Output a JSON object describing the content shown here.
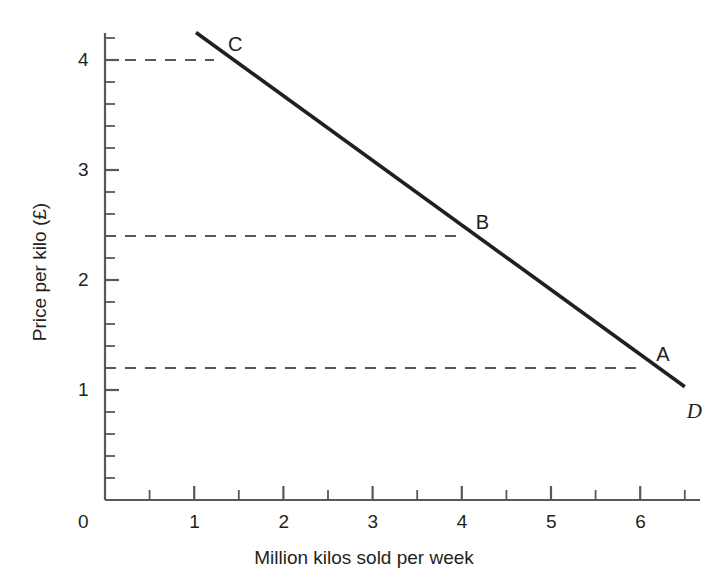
{
  "chart_data": {
    "type": "line",
    "title": "",
    "xlabel": "Million kilos sold per week",
    "ylabel": "Price per kilo (£)",
    "xlim": [
      0,
      6.9
    ],
    "ylim": [
      0,
      4.35
    ],
    "grid": false,
    "legend": "none",
    "x_ticks": [
      "0",
      "1",
      "2",
      "3",
      "4",
      "5",
      "6"
    ],
    "x_tick_values": [
      0,
      1,
      2,
      3,
      4,
      5,
      6
    ],
    "x_minor_step": 0.5,
    "y_ticks": [
      "0",
      "1",
      "2",
      "3",
      "4"
    ],
    "y_tick_values": [
      0,
      1,
      2,
      3,
      4
    ],
    "y_minor_step": 0.2,
    "series": [
      {
        "name": "D",
        "label": "D",
        "style": "solid",
        "color": "#231f20",
        "x": [
          1.02,
          6.5
        ],
        "values": [
          4.25,
          1.03
        ]
      }
    ],
    "annotations": [
      {
        "label": "C",
        "x": 1.2,
        "y": 4.0,
        "leader": "dashed-horizontal"
      },
      {
        "label": "B",
        "x": 4.0,
        "y": 2.4,
        "leader": "dashed-horizontal"
      },
      {
        "label": "A",
        "x": 6.0,
        "y": 1.2,
        "leader": "dashed-horizontal"
      }
    ],
    "curve_label": "D"
  },
  "axes": {
    "y_label": "Price per kilo (£)",
    "x_label": "Million kilos sold per week",
    "origin_label": "0",
    "y_tick_labels": [
      {
        "text": "4",
        "value": 4
      },
      {
        "text": "3",
        "value": 3
      },
      {
        "text": "2",
        "value": 2
      },
      {
        "text": "1",
        "value": 1
      }
    ],
    "x_tick_labels": [
      {
        "text": "1",
        "value": 1
      },
      {
        "text": "2",
        "value": 2
      },
      {
        "text": "3",
        "value": 3
      },
      {
        "text": "4",
        "value": 4
      },
      {
        "text": "5",
        "value": 5
      },
      {
        "text": "6",
        "value": 6
      }
    ]
  },
  "points": {
    "a_label": "A",
    "b_label": "B",
    "c_label": "C",
    "curve_label": "D"
  },
  "colors": {
    "ink": "#231f20",
    "axis": "#58585b",
    "dash": "#58585b",
    "background": "#ffffff"
  }
}
